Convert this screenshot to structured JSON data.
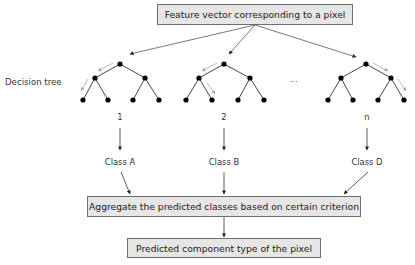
{
  "diagram": {
    "title_box": "Feature vector corresponding to a pixel",
    "side_label": "Decision tree",
    "ellipsis": "...",
    "trees": [
      {
        "index_label": "1",
        "class_label": "Class A"
      },
      {
        "index_label": "2",
        "class_label": "Class B"
      },
      {
        "index_label": "n",
        "class_label": "Class D"
      }
    ],
    "aggregate_box": "Aggregate the predicted classes based on certain criterion",
    "output_box": "Predicted component type of the pixel",
    "colors": {
      "box_fill": "#e6e6e6",
      "box_border": "#6e6e6e",
      "edge": "#333333",
      "node": "#000000",
      "path_arrow": "#aaaaaa"
    }
  }
}
